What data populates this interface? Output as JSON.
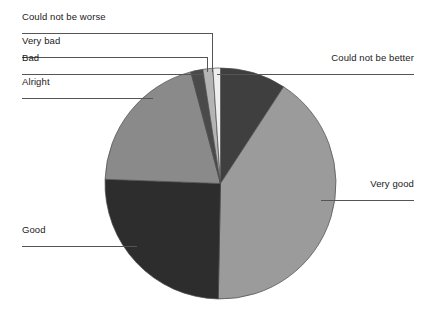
{
  "chart_data": {
    "type": "pie",
    "title": "",
    "xlabel": "",
    "ylabel": "",
    "legend_position": "callout-labels",
    "grid": false,
    "categories": [
      "Could not be better",
      "Very good",
      "Good",
      "Alright",
      "Bad",
      "Very bad",
      "Could not be worse"
    ],
    "values": [
      9.2,
      41.1,
      25.3,
      20.3,
      1.7,
      1.4,
      1.0
    ],
    "units": "percent",
    "total": 100,
    "start_angle_deg": 0,
    "direction": "clockwise",
    "slices": [
      {
        "label": "Could not be better",
        "value": 9.2,
        "color": "#3f3f3f",
        "start_deg": 0,
        "end_deg": 33.1
      },
      {
        "label": "Very good",
        "value": 41.1,
        "color": "#9b9b9b",
        "start_deg": 33.1,
        "end_deg": 181.1
      },
      {
        "label": "Good",
        "value": 25.3,
        "color": "#2d2d2d",
        "start_deg": 181.1,
        "end_deg": 272.1
      },
      {
        "label": "Alright",
        "value": 20.3,
        "color": "#8a8a8a",
        "start_deg": 272.1,
        "end_deg": 345.1
      },
      {
        "label": "Bad",
        "value": 1.7,
        "color": "#4a4a4a",
        "start_deg": 345.1,
        "end_deg": 351.2
      },
      {
        "label": "Very bad",
        "value": 1.4,
        "color": "#b4b4b4",
        "start_deg": 351.2,
        "end_deg": 356.2
      },
      {
        "label": "Could not be worse",
        "value": 1.0,
        "color": "#efefef",
        "start_deg": 356.2,
        "end_deg": 360
      }
    ]
  },
  "labels": {
    "could_not_be_worse": "Could not be worse",
    "very_bad": "Very bad",
    "bad": "Bad",
    "alright": "Alright",
    "good": "Good",
    "could_not_be_better": "Could not be better",
    "very_good": "Very good"
  },
  "style": {
    "background": "#ffffff",
    "leader_line_color": "#555555",
    "outline_color": "#4a4a4a",
    "text_color": "#1a1a1a"
  }
}
